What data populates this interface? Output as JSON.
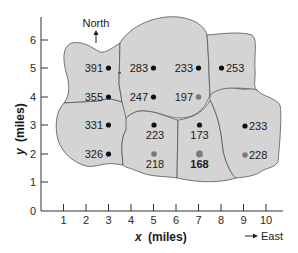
{
  "diagram": {
    "title": "",
    "x_axis": {
      "label_var": "x",
      "label_unit": "(miles)",
      "ticks": [
        "1",
        "2",
        "3",
        "4",
        "5",
        "6",
        "7",
        "8",
        "9",
        "10"
      ]
    },
    "y_axis": {
      "label_var": "y",
      "label_unit": "(miles)",
      "ticks": [
        "0",
        "1",
        "2",
        "3",
        "4",
        "5",
        "6"
      ]
    },
    "directions": {
      "north": "North",
      "east": "East"
    },
    "colors": {
      "region_fill": "#d4d4d4",
      "region_stroke": "#555555",
      "point_black": "#111111",
      "point_gray": "#7a7a7a",
      "axis": "#333333"
    },
    "points": [
      {
        "x": 3,
        "y": 5,
        "value": "391",
        "color": "black",
        "label_side": "left"
      },
      {
        "x": 3,
        "y": 4,
        "value": "355",
        "color": "black",
        "label_side": "left"
      },
      {
        "x": 3,
        "y": 3,
        "value": "331",
        "color": "black",
        "label_side": "left"
      },
      {
        "x": 3,
        "y": 2,
        "value": "326",
        "color": "black",
        "label_side": "left"
      },
      {
        "x": 5,
        "y": 5,
        "value": "283",
        "color": "black",
        "label_side": "left"
      },
      {
        "x": 5,
        "y": 4,
        "value": "247",
        "color": "black",
        "label_side": "left"
      },
      {
        "x": 5,
        "y": 3,
        "value": "223",
        "color": "black",
        "label_side": "below"
      },
      {
        "x": 5,
        "y": 2,
        "value": "218",
        "color": "gray",
        "label_side": "below"
      },
      {
        "x": 7,
        "y": 5,
        "value": "233",
        "color": "black",
        "label_side": "left"
      },
      {
        "x": 7,
        "y": 4,
        "value": "197",
        "color": "gray",
        "label_side": "left"
      },
      {
        "x": 7,
        "y": 3,
        "value": "173",
        "color": "black",
        "label_side": "below"
      },
      {
        "x": 7,
        "y": 2,
        "value": "168",
        "color": "gray",
        "label_side": "below",
        "bold": true
      },
      {
        "x": 8,
        "y": 5,
        "value": "253",
        "color": "black",
        "label_side": "right"
      },
      {
        "x": 9,
        "y": 3,
        "value": "233",
        "color": "black",
        "label_side": "right"
      },
      {
        "x": 9,
        "y": 2,
        "value": "228",
        "color": "gray",
        "label_side": "right"
      }
    ]
  }
}
